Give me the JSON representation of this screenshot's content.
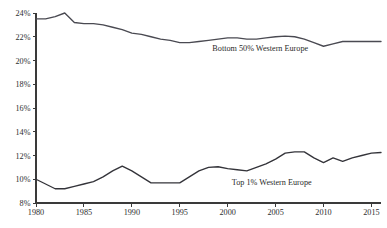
{
  "chart_data": {
    "type": "line",
    "title": "",
    "subtitle": "",
    "xlabel": "",
    "ylabel": "",
    "xlim": [
      1980,
      2016
    ],
    "ylim": [
      8,
      24
    ],
    "grid": false,
    "legend_position": "inline-annotation",
    "x_tick_labels": [
      "1980",
      "1985",
      "1990",
      "1995",
      "2000",
      "2005",
      "2010",
      "2015"
    ],
    "x_ticks": [
      1980,
      1985,
      1990,
      1995,
      2000,
      2005,
      2010,
      2015
    ],
    "y_tick_labels": [
      "8%",
      "10%",
      "12%",
      "14%",
      "16%",
      "18%",
      "20%",
      "22%",
      "24%"
    ],
    "y_ticks": [
      8,
      10,
      12,
      14,
      16,
      18,
      20,
      22,
      24
    ],
    "x": [
      1980,
      1981,
      1982,
      1983,
      1984,
      1985,
      1986,
      1987,
      1988,
      1989,
      1990,
      1991,
      1992,
      1993,
      1994,
      1995,
      1996,
      1997,
      1998,
      1999,
      2000,
      2001,
      2002,
      2003,
      2004,
      2005,
      2006,
      2007,
      2008,
      2009,
      2010,
      2011,
      2012,
      2013,
      2014,
      2015,
      2016
    ],
    "series": [
      {
        "name": "Bottom 50% Western Europe",
        "color": "#4a4a52",
        "label_x": 2003.4,
        "label_y": 20.8,
        "values": [
          23.5,
          23.5,
          23.7,
          24.0,
          23.2,
          23.1,
          23.1,
          23.0,
          22.8,
          22.6,
          22.3,
          22.2,
          22.0,
          21.8,
          21.7,
          21.5,
          21.5,
          21.6,
          21.7,
          21.8,
          21.9,
          21.9,
          21.8,
          21.8,
          21.9,
          22.0,
          22.05,
          22.0,
          21.8,
          21.5,
          21.2,
          21.4,
          21.6,
          21.6,
          21.6,
          21.6,
          21.6
        ]
      },
      {
        "name": "Top 1% Western Europe",
        "color": "#34343a",
        "label_x": 2004.6,
        "label_y": 9.55,
        "values": [
          10.0,
          9.6,
          9.2,
          9.2,
          9.4,
          9.6,
          9.8,
          10.2,
          10.7,
          11.1,
          10.7,
          10.2,
          9.7,
          9.7,
          9.7,
          9.7,
          10.2,
          10.7,
          11.0,
          11.05,
          10.9,
          10.8,
          10.7,
          11.0,
          11.3,
          11.7,
          12.2,
          12.3,
          12.3,
          11.8,
          11.4,
          11.8,
          11.5,
          11.8,
          12.0,
          12.2,
          12.25
        ]
      }
    ]
  }
}
